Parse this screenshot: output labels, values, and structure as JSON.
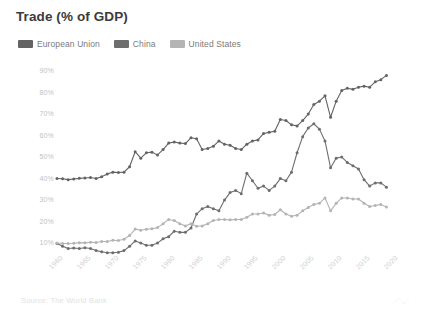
{
  "title": "Trade (% of GDP)",
  "source": "Source: The World Bank",
  "legend": {
    "position": "top-left",
    "items": [
      {
        "label": "European Union",
        "color": "#636363",
        "swatch_name": "legend-swatch-european-union"
      },
      {
        "label": "China",
        "color": "#6e6e6e",
        "swatch_name": "legend-swatch-china"
      },
      {
        "label": "United States",
        "color": "#b4b4b4",
        "swatch_name": "legend-swatch-united-states"
      }
    ]
  },
  "axes": {
    "y_ticks": [
      "90%",
      "80%",
      "70%",
      "60%",
      "50%",
      "40%",
      "30%",
      "20%",
      "10%"
    ],
    "x_ticks": [
      "1960",
      "1965",
      "1970",
      "1975",
      "1980",
      "1985",
      "1990",
      "1995",
      "2000",
      "2005",
      "2010",
      "2015",
      "2020"
    ]
  },
  "chart_data": {
    "type": "line",
    "title": "Trade (% of GDP)",
    "xlabel": "",
    "ylabel": "",
    "xlim": [
      1960,
      2020
    ],
    "ylim": [
      5,
      95
    ],
    "grid": false,
    "legend_position": "top-left",
    "annotations": [
      "Source: The World Bank"
    ],
    "x": [
      1960,
      1961,
      1962,
      1963,
      1964,
      1965,
      1966,
      1967,
      1968,
      1969,
      1970,
      1971,
      1972,
      1973,
      1974,
      1975,
      1976,
      1977,
      1978,
      1979,
      1980,
      1981,
      1982,
      1983,
      1984,
      1985,
      1986,
      1987,
      1988,
      1989,
      1990,
      1991,
      1992,
      1993,
      1994,
      1995,
      1996,
      1997,
      1998,
      1999,
      2000,
      2001,
      2002,
      2003,
      2004,
      2005,
      2006,
      2007,
      2008,
      2009,
      2010,
      2011,
      2012,
      2013,
      2014,
      2015,
      2016,
      2017,
      2018,
      2019
    ],
    "series": [
      {
        "name": "European Union",
        "color": "#636363",
        "values": [
          39.5,
          39.4,
          39.0,
          39.3,
          39.6,
          39.8,
          40.0,
          39.5,
          40.3,
          41.6,
          42.5,
          42.3,
          42.5,
          45.0,
          52.0,
          49.0,
          51.5,
          51.8,
          50.5,
          53.0,
          56.0,
          56.5,
          56.0,
          55.8,
          58.5,
          58.0,
          53.0,
          53.5,
          54.5,
          57.0,
          55.5,
          55.0,
          53.5,
          53.0,
          55.5,
          57.0,
          57.5,
          60.5,
          61.0,
          61.5,
          67.0,
          66.5,
          64.5,
          64.0,
          66.5,
          69.5,
          74.0,
          75.5,
          78.0,
          68.0,
          75.5,
          80.5,
          81.5,
          81.0,
          82.0,
          82.5,
          82.0,
          84.5,
          85.5,
          87.5
        ]
      },
      {
        "name": "China",
        "color": "#6e6e6e",
        "values": [
          9.3,
          8.0,
          7.0,
          7.2,
          7.0,
          7.3,
          7.0,
          6.0,
          5.5,
          5.0,
          5.0,
          5.2,
          6.0,
          8.0,
          10.5,
          9.5,
          8.5,
          8.5,
          9.5,
          11.5,
          12.5,
          15.0,
          14.5,
          14.5,
          16.5,
          23.0,
          25.5,
          26.5,
          25.5,
          24.5,
          29.5,
          33.0,
          34.0,
          32.5,
          42.0,
          38.5,
          35.0,
          36.0,
          34.0,
          36.0,
          39.5,
          38.5,
          42.5,
          51.5,
          59.0,
          63.0,
          65.0,
          62.5,
          57.0,
          44.5,
          49.0,
          49.5,
          47.0,
          45.5,
          44.0,
          39.0,
          36.0,
          37.5,
          37.5,
          35.5
        ]
      },
      {
        "name": "United States",
        "color": "#b4b4b4",
        "values": [
          9.5,
          9.3,
          9.3,
          9.4,
          9.7,
          9.6,
          9.9,
          9.8,
          10.2,
          10.2,
          10.8,
          10.7,
          11.3,
          13.0,
          16.0,
          15.5,
          15.9,
          16.2,
          16.7,
          18.5,
          20.5,
          20.0,
          18.5,
          17.5,
          18.5,
          17.3,
          17.5,
          18.5,
          20.0,
          20.5,
          20.5,
          20.3,
          20.5,
          20.5,
          21.5,
          23.0,
          23.0,
          23.5,
          22.5,
          22.8,
          25.0,
          23.0,
          22.0,
          22.5,
          24.5,
          26.0,
          27.5,
          28.0,
          30.5,
          24.5,
          28.0,
          30.5,
          30.5,
          30.0,
          30.0,
          28.0,
          26.5,
          27.0,
          27.5,
          26.3
        ]
      }
    ]
  }
}
